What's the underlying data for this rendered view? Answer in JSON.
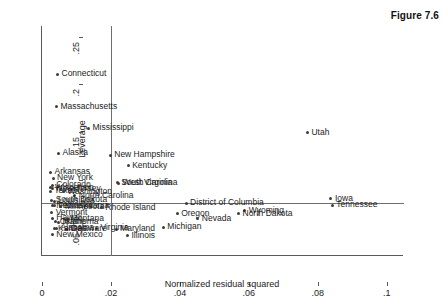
{
  "figure": {
    "caption": "Figure 7.6"
  },
  "chart_data": {
    "type": "scatter",
    "title": "",
    "xlabel": "Normalized residual squared",
    "ylabel": "Leverage",
    "xlim": [
      0,
      0.105
    ],
    "ylim": [
      0.022,
      0.262
    ],
    "xticks": [
      "0",
      ".02",
      ".04",
      ".06",
      ".08",
      ".1"
    ],
    "xtick_values": [
      0,
      0.02,
      0.04,
      0.06,
      0.08,
      0.1
    ],
    "yticks": [
      ".05",
      ".1",
      ".15",
      ".2",
      ".25"
    ],
    "ytick_values": [
      0.05,
      0.1,
      0.15,
      0.2,
      0.25
    ],
    "grid": false,
    "legend": null,
    "reference_lines": [
      {
        "name": "vertical-reference",
        "orient": "vertical",
        "x": 0.02
      },
      {
        "name": "horizontal-reference",
        "orient": "horizontal",
        "y": 0.0775
      }
    ],
    "points": [
      {
        "label": "Connecticut",
        "x": 0.0045,
        "y": 0.2115
      },
      {
        "label": "Massachusetts",
        "x": 0.0042,
        "y": 0.1775
      },
      {
        "label": "Mississippi",
        "x": 0.0135,
        "y": 0.1555
      },
      {
        "label": "Utah",
        "x": 0.077,
        "y": 0.1505
      },
      {
        "label": "Alaska",
        "x": 0.0048,
        "y": 0.129
      },
      {
        "label": "New Hampshire",
        "x": 0.0198,
        "y": 0.1272
      },
      {
        "label": "Kentucky",
        "x": 0.025,
        "y": 0.116
      },
      {
        "label": "Arkansas",
        "x": 0.0025,
        "y": 0.1095
      },
      {
        "label": "New York",
        "x": 0.0032,
        "y": 0.1032
      },
      {
        "label": "South Carolina",
        "x": 0.0218,
        "y": 0.0982
      },
      {
        "label": "West Virginia",
        "x": 0.0222,
        "y": 0.0978
      },
      {
        "label": "Colorado",
        "x": 0.003,
        "y": 0.0958
      },
      {
        "label": "Wisconsin",
        "x": 0.0026,
        "y": 0.093
      },
      {
        "label": "New Jersey",
        "x": 0.003,
        "y": 0.0922
      },
      {
        "label": "Texas",
        "x": 0.0024,
        "y": 0.0895
      },
      {
        "label": "Washington",
        "x": 0.0062,
        "y": 0.0892
      },
      {
        "label": "North Carolina",
        "x": 0.0095,
        "y": 0.0848
      },
      {
        "label": "South Dakota",
        "x": 0.0028,
        "y": 0.08
      },
      {
        "label": "Louisiana",
        "x": 0.0035,
        "y": 0.0792
      },
      {
        "label": "Nebraska",
        "x": 0.003,
        "y": 0.0745
      },
      {
        "label": "Pennsylvania",
        "x": 0.0036,
        "y": 0.0742
      },
      {
        "label": "Minnesota",
        "x": 0.0055,
        "y": 0.0735
      },
      {
        "label": "Rhode Island",
        "x": 0.0172,
        "y": 0.0722
      },
      {
        "label": "Wyoming",
        "x": 0.0588,
        "y": 0.069
      },
      {
        "label": "North Dakota",
        "x": 0.057,
        "y": 0.0662
      },
      {
        "label": "Vermont",
        "x": 0.0028,
        "y": 0.0672
      },
      {
        "label": "Iowa",
        "x": 0.0838,
        "y": 0.0818
      },
      {
        "label": "Tennessee",
        "x": 0.0842,
        "y": 0.0752
      },
      {
        "label": "District of Columbia",
        "x": 0.0418,
        "y": 0.0768
      },
      {
        "label": "Oregon",
        "x": 0.0392,
        "y": 0.066
      },
      {
        "label": "Nevada",
        "x": 0.0452,
        "y": 0.0608
      },
      {
        "label": "Hawaii",
        "x": 0.003,
        "y": 0.0612
      },
      {
        "label": "Montana",
        "x": 0.0072,
        "y": 0.0605
      },
      {
        "label": "Oklahoma",
        "x": 0.004,
        "y": 0.0578
      },
      {
        "label": "Maine",
        "x": 0.0048,
        "y": 0.0572
      },
      {
        "label": "Michigan",
        "x": 0.0352,
        "y": 0.0522
      },
      {
        "label": "Maryland",
        "x": 0.0215,
        "y": 0.0498
      },
      {
        "label": "Virginia",
        "x": 0.0158,
        "y": 0.0512
      },
      {
        "label": "Delaware",
        "x": 0.0072,
        "y": 0.0498
      },
      {
        "label": "Alabama",
        "x": 0.0042,
        "y": 0.0512
      },
      {
        "label": "Kansas",
        "x": 0.0035,
        "y": 0.0502
      },
      {
        "label": "Illinois",
        "x": 0.0248,
        "y": 0.0432
      },
      {
        "label": "New Mexico",
        "x": 0.003,
        "y": 0.0442
      }
    ]
  }
}
